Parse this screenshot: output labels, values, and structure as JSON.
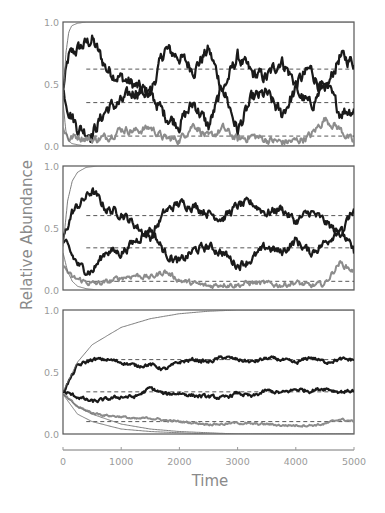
{
  "chart_data": {
    "type": "line",
    "layout": "three stacked panels sharing x axis",
    "xlabel": "Time",
    "ylabel": "Relative Abundance",
    "xlim": [
      0,
      5000
    ],
    "x_ticks": [
      0,
      1000,
      2000,
      3000,
      4000,
      5000
    ],
    "x_tick_labels": [
      "0",
      "1000",
      "2000",
      "3000",
      "4000",
      "5000"
    ],
    "y_ticks": [
      0.0,
      0.5,
      1.0
    ],
    "y_tick_labels": [
      "0.0",
      "0.5",
      "1.0"
    ],
    "grid": false,
    "legend": "none",
    "colors": {
      "dark_series": "#1a1a1a",
      "gray_series": "#8c8c8c",
      "thin_series": "#6e6e6e",
      "dashed_reference": "#444444",
      "frame": "#555555",
      "text": "#9a9a9a"
    },
    "panels": [
      {
        "name": "top",
        "ylim": [
          0,
          1
        ],
        "noise": "high",
        "dashed_levels": [
          0.62,
          0.35,
          0.08
        ],
        "series": [
          {
            "name": "dark-1",
            "style": "thick-dark",
            "start": 0.45,
            "x": [
              0,
              100,
              250,
              500,
              750,
              1000,
              1250,
              1500,
              1750,
              2000,
              2250,
              2500,
              2750,
              3000,
              3250,
              3500,
              3750,
              4000,
              4250,
              4500,
              4750,
              5000
            ],
            "y": [
              0.45,
              0.72,
              0.78,
              0.86,
              0.62,
              0.55,
              0.48,
              0.42,
              0.78,
              0.72,
              0.62,
              0.78,
              0.45,
              0.72,
              0.58,
              0.55,
              0.7,
              0.5,
              0.62,
              0.42,
              0.72,
              0.68
            ]
          },
          {
            "name": "dark-2",
            "style": "thick-dark",
            "start": 0.45,
            "x": [
              0,
              100,
              250,
              500,
              750,
              1000,
              1250,
              1500,
              1750,
              2000,
              2250,
              2500,
              2750,
              3000,
              3250,
              3500,
              3750,
              4000,
              4250,
              4500,
              4750,
              5000
            ],
            "y": [
              0.45,
              0.3,
              0.15,
              0.1,
              0.3,
              0.35,
              0.45,
              0.42,
              0.25,
              0.18,
              0.35,
              0.15,
              0.48,
              0.12,
              0.38,
              0.42,
              0.25,
              0.45,
              0.32,
              0.5,
              0.28,
              0.3
            ]
          },
          {
            "name": "gray-1",
            "style": "medium-gray",
            "start": 0.15,
            "x": [
              0,
              100,
              250,
              500,
              750,
              1000,
              1250,
              1500,
              1750,
              2000,
              2250,
              2500,
              2750,
              3000,
              3250,
              3500,
              3750,
              4000,
              4250,
              4500,
              4750,
              5000
            ],
            "y": [
              0.15,
              0.06,
              0.08,
              0.05,
              0.07,
              0.14,
              0.12,
              0.15,
              0.06,
              0.05,
              0.18,
              0.06,
              0.14,
              0.05,
              0.08,
              0.05,
              0.03,
              0.04,
              0.08,
              0.22,
              0.14,
              0.02
            ]
          },
          {
            "name": "thin-rising",
            "style": "thin-gray",
            "start": 0.35,
            "x": [
              0,
              50,
              100,
              150,
              250,
              400,
              5000
            ],
            "y": [
              0.35,
              0.75,
              0.92,
              0.97,
              0.99,
              1.0,
              1.0
            ]
          },
          {
            "name": "thin-falling",
            "style": "thin-gray",
            "start": 0.35,
            "x": [
              0,
              50,
              100,
              150,
              250,
              400,
              5000
            ],
            "y": [
              0.35,
              0.12,
              0.04,
              0.02,
              0.01,
              0.0,
              0.0
            ]
          }
        ]
      },
      {
        "name": "middle",
        "ylim": [
          0,
          1
        ],
        "noise": "medium",
        "dashed_levels": [
          0.6,
          0.34,
          0.07
        ],
        "series": [
          {
            "name": "dark-1",
            "style": "thick-dark",
            "start": 0.4,
            "x": [
              0,
              150,
              300,
              500,
              750,
              1000,
              1250,
              1500,
              1750,
              2000,
              2250,
              2500,
              2750,
              3000,
              3250,
              3500,
              3750,
              4000,
              4250,
              4500,
              4750,
              5000
            ],
            "y": [
              0.4,
              0.62,
              0.7,
              0.8,
              0.65,
              0.62,
              0.52,
              0.42,
              0.63,
              0.7,
              0.68,
              0.62,
              0.58,
              0.68,
              0.7,
              0.62,
              0.66,
              0.55,
              0.63,
              0.55,
              0.45,
              0.65
            ]
          },
          {
            "name": "dark-2",
            "style": "thick-dark",
            "start": 0.4,
            "x": [
              0,
              150,
              300,
              500,
              750,
              1000,
              1250,
              1500,
              1750,
              2000,
              2250,
              2500,
              2750,
              3000,
              3250,
              3500,
              3750,
              4000,
              4250,
              4500,
              4750,
              5000
            ],
            "y": [
              0.4,
              0.28,
              0.18,
              0.15,
              0.32,
              0.3,
              0.4,
              0.5,
              0.3,
              0.22,
              0.32,
              0.35,
              0.3,
              0.2,
              0.25,
              0.35,
              0.3,
              0.4,
              0.3,
              0.38,
              0.5,
              0.3
            ]
          },
          {
            "name": "gray-1",
            "style": "medium-gray",
            "start": 0.2,
            "x": [
              0,
              150,
              300,
              500,
              750,
              1000,
              1250,
              1500,
              1750,
              2000,
              2250,
              2500,
              2750,
              3000,
              3250,
              3500,
              3750,
              4000,
              4250,
              4500,
              4750,
              5000
            ],
            "y": [
              0.2,
              0.1,
              0.08,
              0.05,
              0.06,
              0.1,
              0.12,
              0.1,
              0.15,
              0.08,
              0.05,
              0.03,
              0.05,
              0.04,
              0.06,
              0.05,
              0.04,
              0.06,
              0.03,
              0.05,
              0.22,
              0.15
            ]
          },
          {
            "name": "thin-rising",
            "style": "thin-gray",
            "start": 0.35,
            "x": [
              0,
              80,
              160,
              250,
              400,
              600,
              5000
            ],
            "y": [
              0.35,
              0.72,
              0.88,
              0.95,
              0.99,
              1.0,
              1.0
            ]
          },
          {
            "name": "thin-falling",
            "style": "thin-gray",
            "start": 0.3,
            "x": [
              0,
              80,
              160,
              250,
              400,
              600,
              5000
            ],
            "y": [
              0.3,
              0.15,
              0.07,
              0.03,
              0.01,
              0.0,
              0.0
            ]
          }
        ]
      },
      {
        "name": "bottom",
        "ylim": [
          0,
          1
        ],
        "noise": "low",
        "dashed_levels": [
          0.6,
          0.34,
          0.1
        ],
        "series": [
          {
            "name": "dark-1",
            "style": "thick-dark",
            "start": 0.34,
            "x": [
              0,
              250,
              500,
              750,
              1000,
              1250,
              1500,
              1750,
              2000,
              2250,
              2500,
              2750,
              3000,
              3250,
              3500,
              3750,
              4000,
              4250,
              4500,
              4750,
              5000
            ],
            "y": [
              0.34,
              0.55,
              0.6,
              0.6,
              0.58,
              0.55,
              0.56,
              0.52,
              0.58,
              0.6,
              0.58,
              0.62,
              0.6,
              0.58,
              0.61,
              0.6,
              0.57,
              0.62,
              0.58,
              0.6,
              0.6
            ]
          },
          {
            "name": "dark-2",
            "style": "thick-dark",
            "start": 0.34,
            "x": [
              0,
              250,
              500,
              750,
              1000,
              1250,
              1500,
              1750,
              2000,
              2250,
              2500,
              2750,
              3000,
              3250,
              3500,
              3750,
              4000,
              4250,
              4500,
              4750,
              5000
            ],
            "y": [
              0.34,
              0.3,
              0.26,
              0.28,
              0.3,
              0.3,
              0.37,
              0.32,
              0.33,
              0.31,
              0.3,
              0.29,
              0.33,
              0.3,
              0.35,
              0.33,
              0.36,
              0.35,
              0.37,
              0.34,
              0.35
            ]
          },
          {
            "name": "gray-1",
            "style": "medium-gray",
            "start": 0.32,
            "x": [
              0,
              250,
              500,
              750,
              1000,
              1250,
              1500,
              1750,
              2000,
              2250,
              2500,
              2750,
              3000,
              3250,
              3500,
              3750,
              4000,
              4250,
              4500,
              4750,
              5000
            ],
            "y": [
              0.32,
              0.22,
              0.17,
              0.15,
              0.14,
              0.12,
              0.13,
              0.11,
              0.1,
              0.09,
              0.08,
              0.08,
              0.09,
              0.08,
              0.08,
              0.07,
              0.07,
              0.07,
              0.08,
              0.12,
              0.1
            ]
          },
          {
            "name": "thin-rising",
            "style": "thin-gray",
            "start": 0.34,
            "x": [
              0,
              250,
              500,
              1000,
              1500,
              2000,
              2500,
              3000,
              3500,
              5000
            ],
            "y": [
              0.34,
              0.58,
              0.72,
              0.86,
              0.93,
              0.97,
              0.99,
              1.0,
              1.0,
              1.0
            ]
          },
          {
            "name": "thin-falling-1",
            "style": "thin-gray",
            "start": 0.32,
            "x": [
              0,
              250,
              500,
              1000,
              1500,
              2000,
              2500,
              3000,
              5000
            ],
            "y": [
              0.32,
              0.22,
              0.16,
              0.08,
              0.04,
              0.02,
              0.01,
              0.0,
              0.0
            ]
          },
          {
            "name": "thin-falling-2",
            "style": "thin-gray",
            "start": 0.32,
            "x": [
              0,
              250,
              500,
              1000,
              1500,
              2000,
              2500,
              3000,
              5000
            ],
            "y": [
              0.32,
              0.16,
              0.1,
              0.04,
              0.02,
              0.01,
              0.0,
              0.0,
              0.0
            ]
          }
        ]
      }
    ]
  }
}
